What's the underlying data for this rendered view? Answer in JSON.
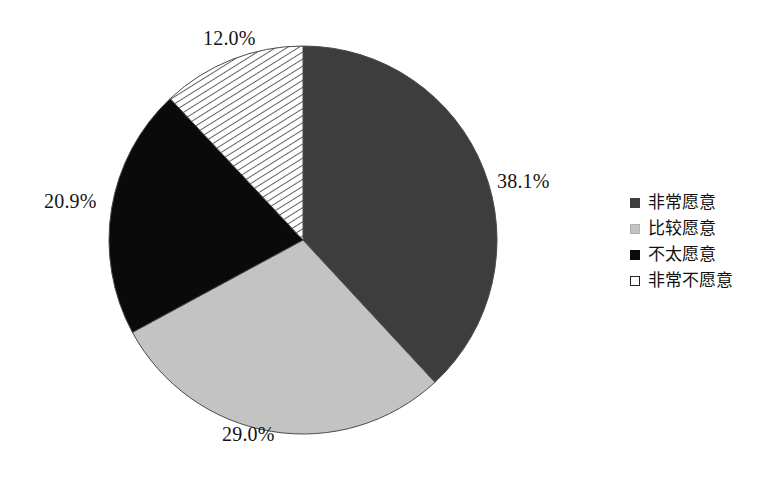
{
  "chart_data": {
    "type": "pie",
    "title": "",
    "subtitle": "",
    "xlabel": "",
    "ylabel": "",
    "legend_position": "right",
    "grid": false,
    "start_angle_deg": 0,
    "direction": "clockwise",
    "categories": [
      "非常愿意",
      "比较愿意",
      "不太愿意",
      "非常不愿意"
    ],
    "values": [
      38.1,
      29.0,
      20.9,
      12.0
    ],
    "value_unit": "%",
    "data_labels": [
      "38.1%",
      "29.0%",
      "20.9%",
      "12.0%"
    ],
    "slice_colors": [
      "#3d3d3d",
      "#c3c3c3",
      "#0a0a0a",
      "#ffffff"
    ],
    "slice_patterns": [
      "solid",
      "solid",
      "solid",
      "diagonal-hatch"
    ],
    "slices": [
      {
        "label": "非常愿意",
        "value": 38.1,
        "data_label": "38.1%",
        "color": "#3d3d3d",
        "pattern": "solid"
      },
      {
        "label": "比较愿意",
        "value": 29.0,
        "data_label": "29.0%",
        "color": "#c3c3c3",
        "pattern": "solid"
      },
      {
        "label": "不太愿意",
        "value": 20.9,
        "data_label": "20.9%",
        "color": "#0a0a0a",
        "pattern": "solid"
      },
      {
        "label": "非常不愿意",
        "value": 12.0,
        "data_label": "12.0%",
        "color": "#ffffff",
        "pattern": "diagonal-hatch"
      }
    ]
  },
  "legend": {
    "items": [
      {
        "label": "非常愿意",
        "color": "#3d3d3d",
        "pattern": "solid"
      },
      {
        "label": "比较愿意",
        "color": "#c3c3c3",
        "pattern": "solid"
      },
      {
        "label": "不太愿意",
        "color": "#0a0a0a",
        "pattern": "solid"
      },
      {
        "label": "非常不愿意",
        "color": "#ffffff",
        "pattern": "outline"
      }
    ]
  },
  "colors": {
    "background": "#ffffff",
    "text": "#111111",
    "slice_1": "#3d3d3d",
    "slice_2": "#c3c3c3",
    "slice_3": "#0a0a0a",
    "slice_4": "#ffffff",
    "outline": "#555555"
  }
}
